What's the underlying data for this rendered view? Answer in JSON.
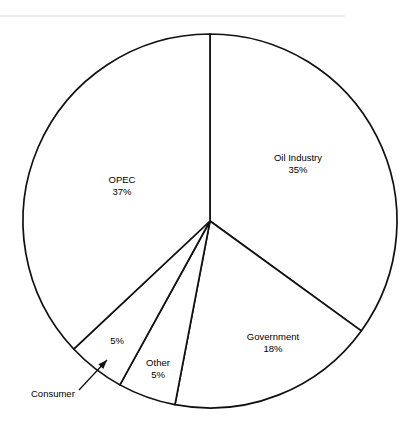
{
  "figure": {
    "name": "pie-chart-figure",
    "background_color": "#ffffff",
    "line_color": "#111111",
    "rule_color": "#d9d9d9"
  },
  "chart_data": {
    "type": "pie",
    "title": "",
    "subtitle": "",
    "xlabel": "",
    "ylabel": "",
    "grid": false,
    "legend_position": "none",
    "label_format": "name above percent",
    "start_angle_deg": 0,
    "direction": "clockwise",
    "center": {
      "x": 210,
      "y": 221
    },
    "radius": 187,
    "categories": [
      "Oil Industry",
      "Government",
      "Other",
      "Consumer",
      "OPEC"
    ],
    "values": [
      35,
      18,
      5,
      5,
      37
    ],
    "units": "%",
    "total": 100,
    "slices": [
      {
        "name": "Oil Industry",
        "percent": 35,
        "value_text": "35%",
        "label_text": "Oil Industry",
        "label_x": 298,
        "label_y": 158,
        "label_placement": "inside",
        "callout": false
      },
      {
        "name": "Government",
        "percent": 18,
        "value_text": "18%",
        "label_text": "Government",
        "label_x": 273,
        "label_y": 337,
        "label_placement": "inside",
        "callout": false
      },
      {
        "name": "Other",
        "percent": 5,
        "value_text": "5%",
        "label_text": "Other",
        "label_x": 158,
        "label_y": 363,
        "label_placement": "inside",
        "callout": false
      },
      {
        "name": "Consumer",
        "percent": 5,
        "value_text": "5%",
        "label_text": "Consumer",
        "label_x": 117,
        "label_y": 341,
        "label_placement": "callout",
        "callout": true,
        "callout_text_x": 31,
        "callout_text_y": 394,
        "leader_from_x": 79,
        "leader_from_y": 390,
        "leader_to_x": 107,
        "leader_to_y": 360
      },
      {
        "name": "OPEC",
        "percent": 37,
        "value_text": "37%",
        "label_text": "OPEC",
        "label_x": 122,
        "label_y": 180,
        "label_placement": "inside",
        "callout": false
      }
    ]
  },
  "decor": {
    "top_rule_label": "top-divider",
    "top_rule_x1": 0,
    "top_rule_x2": 345,
    "top_rule_y": 16
  }
}
